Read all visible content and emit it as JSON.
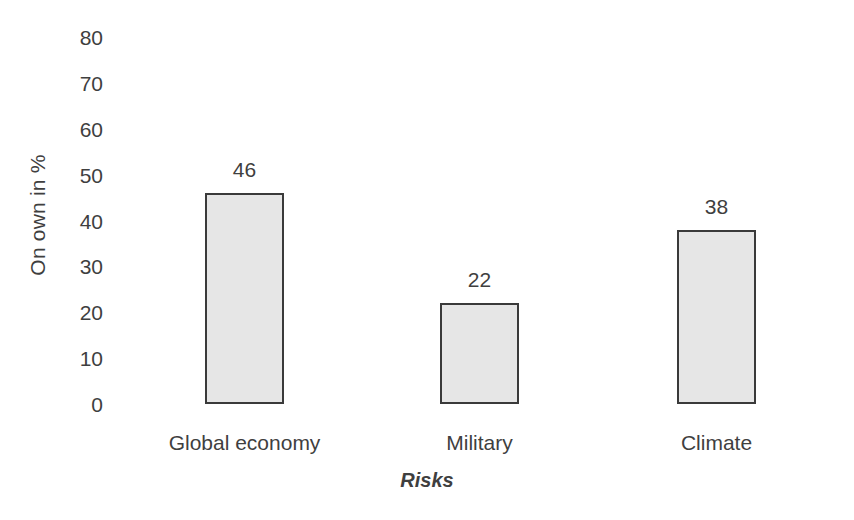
{
  "chart_data": {
    "type": "bar",
    "title": "",
    "subtitle": "",
    "xlabel": "Risks",
    "ylabel": "On own in %",
    "categories": [
      "Global economy",
      "Military",
      "Climate"
    ],
    "values": [
      46,
      22,
      38
    ],
    "data_labels": [
      "46",
      "22",
      "38"
    ],
    "ylim": [
      0,
      80
    ],
    "ytick_values": [
      80,
      70,
      60,
      50,
      40,
      30,
      20,
      10,
      0
    ],
    "ytick_labels": [
      "80",
      "70",
      "60",
      "50",
      "40",
      "30",
      "20",
      "10",
      "0"
    ],
    "ytick_interval": 10,
    "grid": false,
    "axis_lines": false,
    "legend": false,
    "legend_position": "none",
    "series": [
      {
        "name": "On own in %",
        "values": [
          46,
          22,
          38
        ]
      }
    ],
    "style": {
      "bar_fill": "#e6e6e6",
      "bar_border": "#3a3a3a",
      "text_color": "#3f3f3f",
      "background": "#ffffff"
    }
  }
}
